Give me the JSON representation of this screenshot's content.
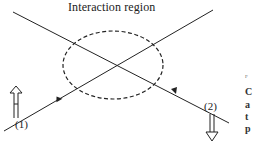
{
  "diagram": {
    "title": "Interaction region",
    "beam_labels": [
      "(1)",
      "(2)"
    ],
    "side_text": {
      "fig_fragment": "F",
      "lines": [
        "C",
        "a",
        "t",
        "p"
      ]
    },
    "colors": {
      "stroke": "#222222",
      "background": "#ffffff"
    }
  }
}
